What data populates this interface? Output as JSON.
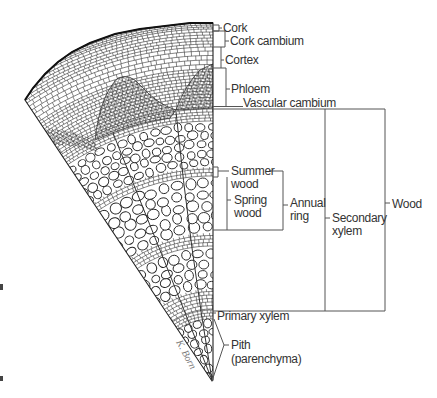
{
  "figure": {
    "colors": {
      "ink": "#333333",
      "bracket": "#555555",
      "background": "#ffffff"
    },
    "artist_signature": "K. Born"
  },
  "labels": {
    "cork": "Cork",
    "cork_cambium": "Cork cambium",
    "cortex": "Cortex",
    "phloem": "Phloem",
    "vascular_cambium": "Vascular cambium",
    "summer_wood_line1": "Summer",
    "summer_wood_line2": "wood",
    "spring_wood_line1": "Spring",
    "spring_wood_line2": "wood",
    "annual_ring_line1": "Annual",
    "annual_ring_line2": "ring",
    "secondary_xylem_line1": "Secondary",
    "secondary_xylem_line2": "xylem",
    "wood": "Wood",
    "primary_xylem": "Primary xylem",
    "pith_line1": "Pith",
    "pith_line2": "(parenchyma)"
  }
}
